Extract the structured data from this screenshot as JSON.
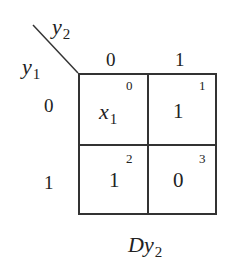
{
  "kmap": {
    "col_var": {
      "base": "y",
      "sub": "2"
    },
    "row_var": {
      "base": "y",
      "sub": "1"
    },
    "col_headers": [
      "0",
      "1"
    ],
    "row_headers": [
      "0",
      "1"
    ],
    "cells": [
      {
        "index": "0",
        "value_base": "x",
        "value_sub": "1"
      },
      {
        "index": "1",
        "value": "1"
      },
      {
        "index": "2",
        "value": "1"
      },
      {
        "index": "3",
        "value": "0"
      }
    ],
    "caption": {
      "base": "Dy",
      "sub": "2"
    }
  }
}
